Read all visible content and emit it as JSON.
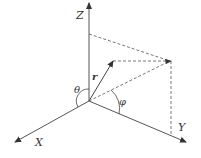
{
  "diagram": {
    "axes": {
      "z": {
        "label": "Z"
      },
      "x": {
        "label": "X"
      },
      "y": {
        "label": "Y"
      }
    },
    "vector": {
      "label": "r"
    },
    "angles": {
      "polar": {
        "label": "θ"
      },
      "azimuth": {
        "label": "φ"
      }
    },
    "colors": {
      "line": "#444444",
      "background": "#ffffff"
    }
  }
}
